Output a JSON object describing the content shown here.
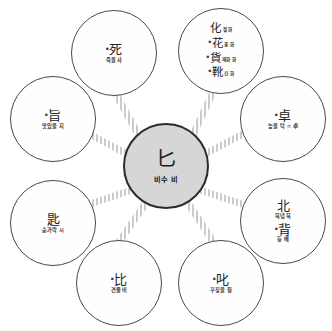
{
  "diagram": {
    "type": "radial-hub-and-spoke",
    "center": {
      "hanja": "匕",
      "gloss": "비수 비"
    },
    "spoke_color": "#c9c9c9",
    "node_border_color": "#4a4a4a",
    "center_fill_color": "#d6d6d6",
    "nodes": [
      {
        "id": "node-sa",
        "position": "top-left",
        "entries": [
          {
            "mark": "▪",
            "hanja": "死",
            "gloss": "죽을 사"
          }
        ]
      },
      {
        "id": "node-hwa",
        "position": "top-right",
        "entries": [
          {
            "mark": "",
            "hanja": "化",
            "gloss": "될 화"
          },
          {
            "mark": "▪",
            "hanja": "花",
            "gloss": "꽃 화"
          },
          {
            "mark": "▪",
            "hanja": "貨",
            "gloss": "재화 화"
          },
          {
            "mark": "▪",
            "hanja": "靴",
            "gloss": "신 화"
          }
        ]
      },
      {
        "id": "node-ji",
        "position": "left-upper",
        "entries": [
          {
            "mark": "▪",
            "hanja": "旨",
            "gloss": "맛있을 지"
          }
        ]
      },
      {
        "id": "node-tak",
        "position": "right-upper",
        "entries": [
          {
            "mark": "▪",
            "hanja": "卓",
            "gloss": "높을 탁 = 卓"
          }
        ]
      },
      {
        "id": "node-si",
        "position": "left-lower",
        "entries": [
          {
            "mark": "",
            "hanja": "匙",
            "gloss": "숟가락 시"
          }
        ]
      },
      {
        "id": "node-buk",
        "position": "right-lower",
        "entries": [
          {
            "mark": "",
            "hanja": "北",
            "gloss": "북녘 북"
          },
          {
            "mark": "▪",
            "hanja": "背",
            "gloss": "등 배"
          }
        ]
      },
      {
        "id": "node-bi",
        "position": "bottom-left",
        "entries": [
          {
            "mark": "▪",
            "hanja": "比",
            "gloss": "견줄 비"
          }
        ]
      },
      {
        "id": "node-jil",
        "position": "bottom-right",
        "entries": [
          {
            "mark": "▪",
            "hanja": "叱",
            "gloss": "꾸짖을 질"
          }
        ]
      }
    ]
  }
}
